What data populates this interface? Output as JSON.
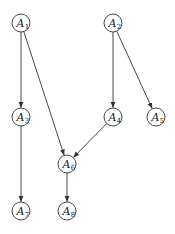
{
  "diagram": {
    "type": "directed-acyclic-graph",
    "node_radius": 9,
    "stroke_color": "#333333",
    "background": "#ffffff",
    "nodes": [
      {
        "id": "A1",
        "letter": "A",
        "sub": "1",
        "x": 21,
        "y": 23
      },
      {
        "id": "A2",
        "letter": "A",
        "sub": "2",
        "x": 113,
        "y": 23
      },
      {
        "id": "A3",
        "letter": "A",
        "sub": "3",
        "x": 21,
        "y": 117
      },
      {
        "id": "A4",
        "letter": "A",
        "sub": "4",
        "x": 113,
        "y": 117
      },
      {
        "id": "A5",
        "letter": "A",
        "sub": "5",
        "x": 156,
        "y": 117
      },
      {
        "id": "A6",
        "letter": "A",
        "sub": "6",
        "x": 67,
        "y": 164
      },
      {
        "id": "A7",
        "letter": "A",
        "sub": "7",
        "x": 21,
        "y": 211
      },
      {
        "id": "A8",
        "letter": "A",
        "sub": "8",
        "x": 67,
        "y": 211
      }
    ],
    "edges": [
      {
        "from": "A1",
        "to": "A3"
      },
      {
        "from": "A1",
        "to": "A6"
      },
      {
        "from": "A2",
        "to": "A4"
      },
      {
        "from": "A2",
        "to": "A5"
      },
      {
        "from": "A3",
        "to": "A7"
      },
      {
        "from": "A4",
        "to": "A6"
      },
      {
        "from": "A6",
        "to": "A8"
      }
    ]
  }
}
